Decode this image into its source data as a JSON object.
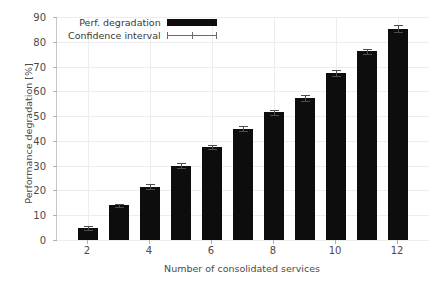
{
  "chart_data": {
    "type": "bar",
    "title": "",
    "xlabel": "Number of consolidated services",
    "ylabel": "Performance degradation [%]",
    "categories": [
      "2",
      "3",
      "4",
      "5",
      "6",
      "7",
      "8",
      "9",
      "10",
      "11",
      "12"
    ],
    "values": [
      4.8,
      14.0,
      21.5,
      30.0,
      37.5,
      45.0,
      51.5,
      57.3,
      67.5,
      76.2,
      85.3
    ],
    "errors": [
      0.8,
      0.7,
      1.0,
      0.9,
      0.9,
      1.1,
      1.0,
      1.1,
      1.2,
      1.0,
      1.3
    ],
    "series": [
      {
        "name": "Perf. degradation",
        "values": [
          4.8,
          14.0,
          21.5,
          30.0,
          37.5,
          45.0,
          51.5,
          57.3,
          67.5,
          76.2,
          85.3
        ]
      }
    ],
    "xlim": [
      1,
      13
    ],
    "ylim": [
      0,
      90
    ],
    "yticks": [
      0,
      10,
      20,
      30,
      40,
      50,
      60,
      70,
      80,
      90
    ],
    "ytick_labels": [
      "0",
      "10",
      "20",
      "30",
      "40",
      "50",
      "60",
      "70",
      "80",
      "90"
    ],
    "xticks": [
      2,
      4,
      6,
      8,
      10,
      12
    ],
    "xtick_labels": [
      "2",
      "4",
      "6",
      "8",
      "10",
      "12"
    ],
    "grid": true,
    "legend_position": "upper left",
    "legend": [
      {
        "label": "Perf. degradation",
        "marker": "bar",
        "color": "#0d0d0d"
      },
      {
        "label": "Confidence interval",
        "marker": "errorbar",
        "color": "#6a6a6a"
      }
    ],
    "colors": {
      "bar": "#0d0d0d",
      "error": "#4d4d4d",
      "grid": "#ededed",
      "axis": "#c8c8c8",
      "text": "#4a4a4a",
      "background": "#ffffff"
    }
  }
}
